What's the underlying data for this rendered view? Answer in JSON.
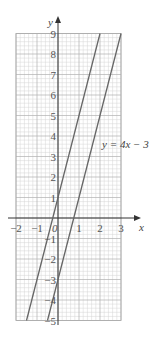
{
  "chart_data": {
    "type": "line",
    "title": "",
    "xlabel": "x",
    "ylabel": "y",
    "xlim": [
      -2,
      3
    ],
    "ylim": [
      -5,
      9
    ],
    "grid": true,
    "x_ticks": [
      "-2",
      "-1",
      "0",
      "1",
      "2",
      "3"
    ],
    "y_ticks": [
      "-5",
      "-4",
      "-3",
      "-2",
      "-1",
      "1",
      "2",
      "3",
      "4",
      "5",
      "6",
      "7",
      "8",
      "9"
    ],
    "origin_label": "0",
    "series": [
      {
        "name": "y = 4x + 1",
        "equation": "y = 4x + 1",
        "slope": 4,
        "intercept": 1,
        "x": [
          -1.5,
          2
        ],
        "y": [
          -5,
          9
        ],
        "labeled": false
      },
      {
        "name": "y = 4x - 3",
        "equation": "y = 4x − 3",
        "slope": 4,
        "intercept": -3,
        "x": [
          -0.5,
          3
        ],
        "y": [
          -5,
          9
        ],
        "labeled": true
      }
    ],
    "annotations": [
      {
        "text": "y = 4x − 3",
        "x": 2.1,
        "y": 3.4
      }
    ]
  }
}
